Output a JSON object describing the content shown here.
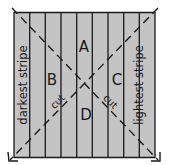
{
  "diagram": {
    "stripe_count": 9,
    "fill_color": "#c4c4c4",
    "line_color": "#1a1a1a",
    "regions": {
      "top": "A",
      "left": "B",
      "right": "C",
      "bottom": "D"
    },
    "side_labels": {
      "left": "darkest stripe",
      "right": "lightest stripe"
    },
    "cut_labels": {
      "left": "cut",
      "right": "cut"
    }
  }
}
